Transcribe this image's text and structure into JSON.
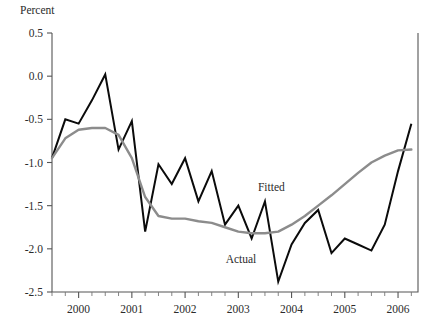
{
  "chart_data": {
    "type": "line",
    "title": "",
    "subtitle": "",
    "xlabel": "",
    "ylabel": "Percent",
    "ylim": [
      -2.5,
      0.5
    ],
    "xlim": [
      1999.5,
      2006.375
    ],
    "grid": false,
    "legend_position": "inline-annotations",
    "ytick_labels": [
      "0.5",
      "0.0",
      "-0.5",
      "-1.0",
      "-1.5",
      "-2.0",
      "-2.5"
    ],
    "ytick_values": [
      0.5,
      0.0,
      -0.5,
      -1.0,
      -1.5,
      -2.0,
      -2.5
    ],
    "xtick_labels": [
      "2000",
      "2001",
      "2002",
      "2003",
      "2004",
      "2005",
      "2006"
    ],
    "xtick_values": [
      2000,
      2001,
      2002,
      2003,
      2004,
      2005,
      2006
    ],
    "x_minor_interval": 0.25,
    "x": [
      1999.5,
      1999.75,
      2000.0,
      2000.25,
      2000.5,
      2000.75,
      2001.0,
      2001.25,
      2001.5,
      2001.75,
      2002.0,
      2002.25,
      2002.5,
      2002.75,
      2003.0,
      2003.25,
      2003.5,
      2003.75,
      2004.0,
      2004.25,
      2004.5,
      2004.75,
      2005.0,
      2005.25,
      2005.5,
      2005.75,
      2006.0,
      2006.25
    ],
    "series": [
      {
        "name": "Actual",
        "color": "#0b0b0b",
        "label_x": 2003.05,
        "label_y": -2.16,
        "values": [
          -0.95,
          -0.5,
          -0.55,
          -0.28,
          0.02,
          -0.85,
          -0.52,
          -1.8,
          -1.02,
          -1.25,
          -0.95,
          -1.45,
          -1.1,
          -1.72,
          -1.5,
          -1.88,
          -1.45,
          -2.38,
          -1.95,
          -1.7,
          -1.55,
          -2.05,
          -1.88,
          -1.95,
          -2.02,
          -1.72,
          -1.1,
          -0.55
        ]
      },
      {
        "name": "Fitted",
        "color": "#8c8c8c",
        "label_x": 2003.62,
        "label_y": -1.33,
        "values": [
          -0.95,
          -0.72,
          -0.62,
          -0.6,
          -0.6,
          -0.68,
          -0.95,
          -1.4,
          -1.62,
          -1.65,
          -1.65,
          -1.68,
          -1.7,
          -1.75,
          -1.8,
          -1.82,
          -1.82,
          -1.8,
          -1.72,
          -1.62,
          -1.5,
          -1.38,
          -1.25,
          -1.12,
          -1.0,
          -0.92,
          -0.86,
          -0.85
        ]
      }
    ]
  }
}
